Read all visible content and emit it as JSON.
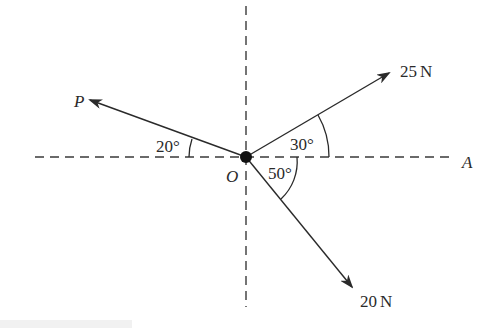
{
  "diagram": {
    "origin_label": "O",
    "reference_axis_label": "A",
    "forces": [
      {
        "id": "force-25n",
        "label": "25 N",
        "magnitude": "25",
        "unit": "N",
        "angle_label": "30°",
        "angle_deg": 30,
        "measured_from": "OA, above"
      },
      {
        "id": "force-20n",
        "label": "20 N",
        "magnitude": "20",
        "unit": "N",
        "angle_label": "50°",
        "angle_deg": 50,
        "measured_from": "OA, below"
      },
      {
        "id": "force-p",
        "label": "P",
        "magnitude": "P",
        "unit": "",
        "angle_label": "20°",
        "angle_deg": 20,
        "measured_from": "negative OA, above"
      }
    ],
    "labels": {
      "p": "P",
      "o": "O",
      "a": "A",
      "f25_num": "25",
      "f25_unit": "N",
      "f20_num": "20",
      "f20_unit": "N",
      "angle_30": "30°",
      "angle_50": "50°",
      "angle_20": "20°"
    },
    "colors": {
      "line": "#2a2a2a",
      "dash": "#3a3a3a",
      "background": "#ffffff"
    }
  }
}
